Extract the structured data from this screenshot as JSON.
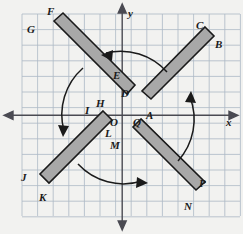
{
  "figure": {
    "background_color": "#f2f2f0",
    "grid": {
      "line_color": "#a9b6c4",
      "cell_size": 15.6,
      "x_min": 22,
      "x_max": 240,
      "y_min": 14,
      "y_max": 216,
      "columns": 14,
      "rows": 13
    },
    "axes": {
      "color": "#4a4a52",
      "x_axis_y": 115,
      "y_axis_x": 122,
      "x_label": "x",
      "y_label": "y",
      "arrowheads": [
        "left",
        "right",
        "up",
        "down"
      ]
    },
    "bars": {
      "fill_color": "#a8a8a8",
      "stroke_color": "#1a1a1a",
      "count": 4
    },
    "arcs": {
      "color": "#1a1a1a",
      "count": 4,
      "directions": [
        "left",
        "down",
        "right",
        "up"
      ]
    }
  },
  "labels": {
    "points": [
      {
        "name": "F",
        "text": "F",
        "x": 47,
        "y": 6
      },
      {
        "name": "G",
        "text": "G",
        "x": 27,
        "y": 24
      },
      {
        "name": "C",
        "text": "C",
        "x": 196,
        "y": 20
      },
      {
        "name": "B",
        "text": "B",
        "x": 215,
        "y": 39
      },
      {
        "name": "E",
        "text": "E",
        "x": 113,
        "y": 70
      },
      {
        "name": "D",
        "text": "D",
        "x": 121,
        "y": 88
      },
      {
        "name": "H",
        "text": "H",
        "x": 96,
        "y": 98
      },
      {
        "name": "I",
        "text": "I",
        "x": 85,
        "y": 105
      },
      {
        "name": "O",
        "text": "O",
        "x": 110,
        "y": 117
      },
      {
        "name": "Q",
        "text": "Q",
        "x": 133,
        "y": 117
      },
      {
        "name": "A",
        "text": "A",
        "x": 146,
        "y": 110
      },
      {
        "name": "L",
        "text": "L",
        "x": 105,
        "y": 128
      },
      {
        "name": "M",
        "text": "M",
        "x": 110,
        "y": 140
      },
      {
        "name": "J",
        "text": "J",
        "x": 21,
        "y": 172
      },
      {
        "name": "K",
        "text": "K",
        "x": 39,
        "y": 192
      },
      {
        "name": "P",
        "text": "P",
        "x": 199,
        "y": 178
      },
      {
        "name": "N",
        "text": "N",
        "x": 184,
        "y": 201
      }
    ],
    "axis": [
      {
        "name": "x-axis-label",
        "text": "x",
        "x": 226,
        "y": 117
      },
      {
        "name": "y-axis-label",
        "text": "y",
        "x": 128,
        "y": 8
      }
    ]
  }
}
